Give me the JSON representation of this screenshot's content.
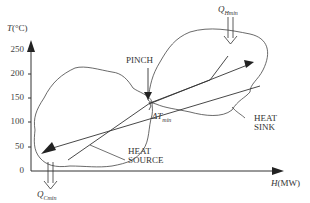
{
  "diagram": {
    "y_axis": {
      "label_var": "T",
      "label_unit": "(°C)",
      "ticks": [
        "250",
        "200",
        "150",
        "100",
        "50",
        "0"
      ]
    },
    "x_axis": {
      "label_var": "H",
      "label_unit": "(MW)"
    },
    "labels": {
      "pinch": "PINCH",
      "delta_t": "ΔT",
      "delta_t_sub": "min",
      "heat_sink_line1": "HEAT",
      "heat_sink_line2": "SINK",
      "heat_source_line1": "HEAT",
      "heat_source_line2": "SOURCE",
      "q_hmin": "Q",
      "q_hmin_sub": "Hmin",
      "q_cmin": "Q",
      "q_cmin_sub": "Cmin"
    },
    "colors": {
      "line": "#333333",
      "background": "#ffffff"
    }
  }
}
